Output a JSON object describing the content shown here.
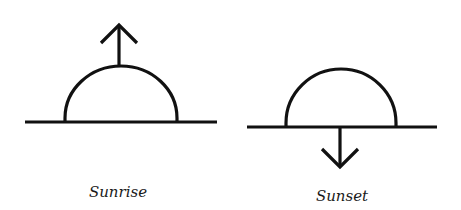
{
  "diagram": {
    "panels": [
      {
        "id": "sunrise",
        "label": "Sunrise",
        "arrow_direction": "up"
      },
      {
        "id": "sunset",
        "label": "Sunset",
        "arrow_direction": "down"
      }
    ],
    "colors": {
      "stroke": "#111111",
      "background": "#ffffff"
    }
  }
}
